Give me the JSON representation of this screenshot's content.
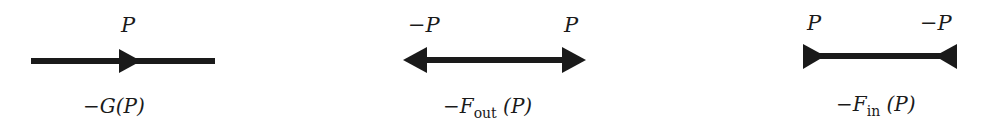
{
  "colors": {
    "stroke": "#1a1a1a",
    "background": "#ffffff"
  },
  "propagators": [
    {
      "id": "G",
      "arrow_type": "single-forward",
      "end_labels": [
        "P"
      ],
      "caption": {
        "prefix": "−",
        "symbol": "G",
        "subscript": "",
        "argument": "(P)"
      }
    },
    {
      "id": "F_out",
      "arrow_type": "double-outward",
      "end_labels": [
        "−P",
        "P"
      ],
      "caption": {
        "prefix": "−",
        "symbol": "F",
        "subscript": "out",
        "argument": "(P)"
      }
    },
    {
      "id": "F_in",
      "arrow_type": "double-inward",
      "end_labels": [
        "P",
        "−P"
      ],
      "caption": {
        "prefix": "−",
        "symbol": "F",
        "subscript": "in",
        "argument": "(P)"
      }
    }
  ]
}
